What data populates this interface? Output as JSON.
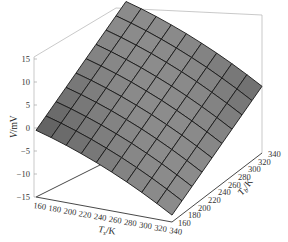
{
  "chart_data": {
    "type": "surface3d",
    "title": "",
    "xlabel": "T_s/K",
    "ylabel": "T_b/K",
    "zlabel": "V/mV",
    "x_ticks": [
      160,
      180,
      200,
      220,
      240,
      260,
      280,
      300,
      320,
      340
    ],
    "y_ticks": [
      160,
      180,
      200,
      220,
      240,
      260,
      280,
      300,
      320,
      340
    ],
    "z_ticks": [
      15,
      10,
      5,
      0,
      -5,
      -10,
      -15
    ],
    "xlim": [
      160,
      340
    ],
    "ylim": [
      160,
      340
    ],
    "zlim": [
      -15,
      15
    ],
    "grid": false,
    "colormap": "gray",
    "surface_corners": {
      "Ts160_Tb160": 0,
      "Ts340_Tb160": -13,
      "Ts160_Tb340": 13,
      "Ts340_Tb340": 0
    }
  },
  "labels": {
    "z_main": "V",
    "z_unit": "/mV",
    "x_main": "T",
    "x_sub": "s",
    "x_unit": "/K",
    "y_main": "T",
    "y_sub": "b",
    "y_unit": "/K"
  }
}
